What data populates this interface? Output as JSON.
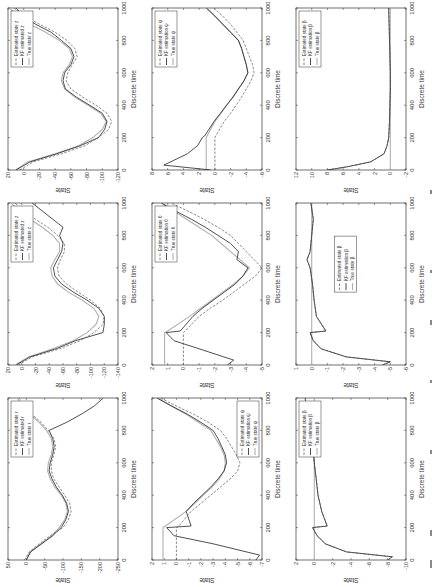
{
  "figure": {
    "xlabel": "Discrete time",
    "ylabel": "State",
    "xticks": [
      0,
      200,
      400,
      600,
      800,
      1000
    ],
    "colors": {
      "estimated": "#555555",
      "kf": "#222222",
      "true": "#b0b0b0",
      "axis": "#333333"
    }
  },
  "chart_data": [
    {
      "id": "r1c1",
      "type": "line",
      "state": "r",
      "ylim": [
        -250,
        50
      ],
      "yticks": [
        50,
        0,
        -50,
        -100,
        -150,
        -200,
        -250
      ],
      "legend": [
        "Estimated state r",
        "KF estimated r",
        "True state r"
      ],
      "legend_pos": "upper-right",
      "x": [
        0,
        50,
        100,
        150,
        200,
        250,
        300,
        350,
        400,
        450,
        500,
        550,
        600,
        650,
        700,
        750,
        800,
        850,
        900,
        950,
        1000
      ],
      "series": [
        {
          "name": "True state r",
          "values": [
            0,
            -10,
            -40,
            -70,
            -90,
            -105,
            -112,
            -108,
            -95,
            -78,
            -65,
            -58,
            -60,
            -68,
            -72,
            -68,
            -55,
            -35,
            -10,
            10,
            25
          ]
        },
        {
          "name": "KF estimated r",
          "values": [
            0,
            -12,
            -42,
            -72,
            -95,
            -108,
            -115,
            -110,
            -98,
            -82,
            -70,
            -62,
            -65,
            -72,
            -76,
            -72,
            -62,
            -110,
            -150,
            -185,
            -210
          ]
        },
        {
          "name": "Estimated state r",
          "values": [
            5,
            -8,
            -35,
            -65,
            -100,
            -115,
            -122,
            -118,
            -105,
            -90,
            -75,
            -68,
            -68,
            -75,
            -80,
            -75,
            -60,
            -40,
            -15,
            5,
            20
          ]
        }
      ]
    },
    {
      "id": "r1c2",
      "type": "line",
      "state": "z",
      "ylim": [
        -140,
        20
      ],
      "yticks": [
        20,
        0,
        -20,
        -40,
        -60,
        -80,
        -100,
        -120,
        -140
      ],
      "legend": [
        "Estimated state z",
        "KF estimated z",
        "True state z"
      ],
      "legend_pos": "upper-right",
      "x": [
        0,
        50,
        100,
        150,
        200,
        250,
        300,
        350,
        400,
        450,
        500,
        550,
        600,
        650,
        700,
        750,
        800,
        850,
        900,
        950,
        1000
      ],
      "series": [
        {
          "name": "True state z",
          "values": [
            10,
            -10,
            -45,
            -75,
            -95,
            -108,
            -112,
            -105,
            -88,
            -68,
            -52,
            -44,
            -42,
            -48,
            -55,
            -55,
            -45,
            -30,
            -12,
            5,
            15
          ]
        },
        {
          "name": "KF estimated z",
          "values": [
            8,
            -12,
            -50,
            -78,
            -118,
            -120,
            -120,
            -112,
            -95,
            -75,
            -58,
            -48,
            -46,
            -52,
            -58,
            -60,
            -55,
            -60,
            -45,
            -30,
            -15
          ]
        },
        {
          "name": "Estimated state z",
          "values": [
            5,
            -15,
            -55,
            -85,
            -105,
            -118,
            -120,
            -114,
            -100,
            -82,
            -65,
            -54,
            -52,
            -56,
            -62,
            -62,
            -52,
            -38,
            -20,
            -2,
            10
          ]
        }
      ]
    },
    {
      "id": "r1c3",
      "type": "line",
      "state": "z",
      "ylim": [
        -120,
        20
      ],
      "yticks": [
        20,
        0,
        -20,
        -40,
        -60,
        -80,
        -100,
        -120
      ],
      "legend": [
        "Estimated state z",
        "KF estimated z",
        "True state z"
      ],
      "legend_pos": "upper-right",
      "x": [
        0,
        50,
        100,
        150,
        200,
        250,
        300,
        350,
        400,
        450,
        500,
        550,
        600,
        650,
        700,
        750,
        800,
        850,
        900,
        950,
        1000
      ],
      "series": [
        {
          "name": "True state z",
          "values": [
            10,
            -5,
            -40,
            -70,
            -88,
            -100,
            -105,
            -98,
            -82,
            -65,
            -52,
            -48,
            -50,
            -58,
            -62,
            -58,
            -45,
            -28,
            -8,
            8,
            18
          ]
        },
        {
          "name": "KF estimated z",
          "values": [
            10,
            -8,
            -42,
            -72,
            -95,
            -103,
            -106,
            -100,
            -84,
            -67,
            -53,
            -50,
            -52,
            -60,
            -64,
            -60,
            -48,
            -35,
            -15,
            0,
            10
          ]
        },
        {
          "name": "Estimated state z",
          "values": [
            5,
            -12,
            -48,
            -78,
            -95,
            -108,
            -112,
            -106,
            -92,
            -75,
            -60,
            -54,
            -56,
            -62,
            -68,
            -65,
            -55,
            -40,
            -20,
            0,
            12
          ]
        }
      ]
    },
    {
      "id": "r2c1",
      "type": "line",
      "state": "ψ",
      "ylim": [
        -7,
        2
      ],
      "yticks": [
        2,
        1,
        0,
        -1,
        -2,
        -3,
        -4,
        -5,
        -6,
        -7
      ],
      "legend": [
        "Estimated state ψ",
        "KF estimation ψ",
        "True state ψ"
      ],
      "legend_pos": "lower-right",
      "x": [
        0,
        30,
        100,
        150,
        200,
        210,
        300,
        350,
        400,
        450,
        500,
        550,
        600,
        650,
        700,
        750,
        800,
        850,
        900,
        950,
        1000
      ],
      "series": [
        {
          "name": "True state ψ",
          "values": [
            1.1,
            1.1,
            1.1,
            1.1,
            1.1,
            0.9,
            -0.8,
            -1.5,
            -2.2,
            -2.9,
            -3.5,
            -3.9,
            -4.0,
            -3.9,
            -3.6,
            -3.2,
            -2.8,
            -1.8,
            -0.8,
            0.4,
            1.5
          ]
        },
        {
          "name": "KF estimation ψ",
          "values": [
            -6.5,
            -6.8,
            -3,
            0.2,
            0.8,
            -1.2,
            -0.8,
            -1.4,
            -2.1,
            -2.8,
            -3.4,
            -3.9,
            -4.1,
            -4.0,
            -3.7,
            -3.4,
            -3.0,
            -2.0,
            -0.9,
            0.4,
            1.6
          ]
        },
        {
          "name": "Estimated state ψ",
          "values": [
            0,
            0,
            0,
            0,
            0,
            -0.2,
            -1.2,
            -2.0,
            -2.8,
            -3.6,
            -4.4,
            -5.0,
            -5.2,
            -4.9,
            -4.5,
            -4.1,
            -3.6,
            -2.6,
            -1.4,
            0,
            1.3
          ]
        }
      ]
    },
    {
      "id": "r2c2",
      "type": "line",
      "state": "θ",
      "ylim": [
        -5,
        2
      ],
      "yticks": [
        2,
        1,
        0,
        -1,
        -2,
        -3,
        -4,
        -5
      ],
      "legend": [
        "Estimated state θ",
        "KF estimation θ",
        "True state θ"
      ],
      "legend_pos": "upper-right",
      "x": [
        0,
        30,
        100,
        150,
        200,
        210,
        300,
        350,
        400,
        450,
        500,
        550,
        600,
        650,
        700,
        750,
        800,
        850,
        900,
        950,
        1000
      ],
      "series": [
        {
          "name": "True state θ",
          "values": [
            1.2,
            1.2,
            1.2,
            1.2,
            1.2,
            1.0,
            -0.4,
            -1.1,
            -1.8,
            -2.5,
            -3.2,
            -3.8,
            -4.2,
            -3.6,
            -3.0,
            -2.4,
            -1.8,
            -1.0,
            -0.2,
            0.6,
            1.4
          ]
        },
        {
          "name": "KF estimation θ",
          "values": [
            -2.8,
            -3.2,
            -1.0,
            0.6,
            1.1,
            0.2,
            -0.6,
            -1.2,
            -1.9,
            -2.6,
            -3.3,
            -3.8,
            -4.1,
            -3.4,
            -3.5,
            -3.0,
            -2.2,
            -1.4,
            -0.5,
            0.5,
            1.4
          ]
        },
        {
          "name": "Estimated state θ",
          "values": [
            0,
            0,
            0,
            0,
            0,
            -0.1,
            -1.0,
            -1.7,
            -2.5,
            -3.2,
            -3.9,
            -4.6,
            -5.0,
            -4.5,
            -4.0,
            -3.5,
            -3.0,
            -2.2,
            -1.3,
            -0.3,
            0.8
          ]
        }
      ]
    },
    {
      "id": "r2c3",
      "type": "line",
      "state": "ψ",
      "ylim": [
        -6,
        8
      ],
      "yticks": [
        8,
        6,
        4,
        2,
        0,
        -2,
        -4,
        -6
      ],
      "legend": [
        "Estimated state ψ",
        "KF estimation ψ",
        "True state ψ"
      ],
      "legend_pos": "upper-right",
      "x": [
        0,
        30,
        100,
        150,
        200,
        210,
        300,
        350,
        400,
        450,
        500,
        550,
        600,
        650,
        700,
        750,
        800,
        850,
        900,
        950,
        1000
      ],
      "series": [
        {
          "name": "True state ψ",
          "values": [
            1.1,
            1.1,
            1.1,
            1.1,
            1.1,
            1.0,
            0.0,
            -0.8,
            -1.5,
            -2.3,
            -3.0,
            -3.7,
            -4.2,
            -4.0,
            -3.7,
            -3.4,
            -3.0,
            -2.0,
            -1.0,
            0.0,
            1.0
          ]
        },
        {
          "name": "KF estimation ψ",
          "values": [
            0.5,
            6.5,
            3.5,
            2.2,
            1.6,
            1.3,
            0.1,
            -0.7,
            -1.5,
            -2.3,
            -3.0,
            -3.7,
            -4.2,
            -4.0,
            -3.7,
            -3.4,
            -3.0,
            -2.0,
            -1.0,
            0.0,
            1.1
          ]
        },
        {
          "name": "Estimated state ψ",
          "values": [
            0,
            0,
            0,
            0,
            0,
            -0.1,
            -1.2,
            -2.0,
            -2.7,
            -3.4,
            -4.0,
            -4.6,
            -5.0,
            -4.8,
            -4.4,
            -4.0,
            -3.6,
            -2.8,
            -2.0,
            -1.0,
            0.2
          ]
        }
      ]
    },
    {
      "id": "r3c1",
      "type": "line",
      "state": "β",
      "ylim": [
        -10,
        2
      ],
      "yticks": [
        2,
        0,
        -2,
        -4,
        -6,
        -8,
        -10
      ],
      "legend": [
        "Estimated state β",
        "KF estimation β",
        "True state β"
      ],
      "legend_pos": "upper-right",
      "x": [
        0,
        20,
        50,
        100,
        150,
        200,
        210,
        300,
        400,
        500,
        600,
        700,
        800,
        900,
        1000
      ],
      "series": [
        {
          "name": "True state β",
          "values": [
            0,
            0,
            0,
            0,
            0,
            0,
            0,
            0,
            0,
            0,
            0,
            0,
            0,
            0,
            0
          ]
        },
        {
          "name": "KF estimation β",
          "values": [
            -8,
            -8.5,
            -3.5,
            -1.2,
            -0.3,
            0.2,
            -1.4,
            -0.8,
            -0.4,
            -0.2,
            0,
            0.2,
            0.5,
            0.8,
            1.0
          ]
        },
        {
          "name": "Estimated state β",
          "values": [
            -8,
            -8.5,
            -3.5,
            -1.2,
            -0.3,
            0.2,
            -1.4,
            -0.8,
            -0.4,
            -0.2,
            0,
            0.2,
            0.5,
            0.8,
            1.0
          ]
        }
      ]
    },
    {
      "id": "r3c2",
      "type": "line",
      "state": "β",
      "ylim": [
        -6,
        1
      ],
      "yticks": [
        1,
        0,
        -1,
        -2,
        -3,
        -4,
        -5,
        -6
      ],
      "legend": [
        "Estimated state β",
        "KF estimation β",
        "True state β"
      ],
      "legend_pos": "center",
      "x": [
        0,
        20,
        50,
        100,
        150,
        200,
        210,
        300,
        400,
        500,
        600,
        650,
        700,
        800,
        900,
        1000
      ],
      "series": [
        {
          "name": "True state β",
          "values": [
            0,
            0,
            0,
            0,
            0,
            0,
            0,
            0,
            0,
            0,
            0,
            0,
            0,
            0,
            0,
            0
          ]
        },
        {
          "name": "KF estimation β",
          "values": [
            -4.5,
            -5.0,
            -2.2,
            -0.6,
            -0.1,
            0.1,
            -0.9,
            -0.3,
            -0.15,
            -0.05,
            0.1,
            0.3,
            0.1,
            0.0,
            -0.1,
            0.05
          ]
        },
        {
          "name": "Estimated state β",
          "values": [
            -4.5,
            -5.0,
            -2.2,
            -0.6,
            -0.1,
            0.1,
            -0.9,
            -0.3,
            -0.15,
            -0.05,
            0.1,
            0.3,
            0.1,
            0.0,
            -0.1,
            0.05
          ]
        }
      ]
    },
    {
      "id": "r3c3",
      "type": "line",
      "state": "β",
      "ylim": [
        -2,
        12
      ],
      "yticks": [
        12,
        10,
        8,
        6,
        4,
        2,
        0,
        -2
      ],
      "legend": [
        "Estimated state β",
        "KF estimation β",
        "True state β"
      ],
      "legend_pos": "upper-right",
      "x": [
        0,
        20,
        50,
        100,
        150,
        200,
        300,
        400,
        500,
        600,
        700,
        800,
        900,
        1000
      ],
      "series": [
        {
          "name": "True state β",
          "values": [
            0,
            0,
            0,
            0,
            0,
            0,
            0,
            0,
            0,
            0,
            0,
            0,
            0,
            0
          ]
        },
        {
          "name": "KF estimation β",
          "values": [
            8,
            5.5,
            2.5,
            0.8,
            0.4,
            0.2,
            0.1,
            0.05,
            0.0,
            0.0,
            0.05,
            0.1,
            0.15,
            0.2
          ]
        },
        {
          "name": "Estimated state β",
          "values": [
            8,
            5.5,
            2.5,
            0.8,
            0.4,
            0.2,
            0.1,
            0.05,
            0.0,
            0.0,
            0.05,
            0.1,
            0.15,
            0.2
          ]
        }
      ]
    }
  ]
}
